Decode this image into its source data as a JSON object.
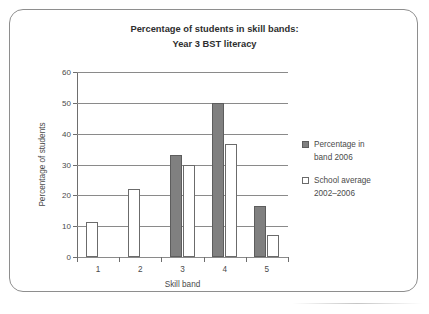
{
  "chart_data": {
    "type": "bar",
    "title": "Percentage of students in skill bands: Year 3 BST literacy",
    "title_lines": [
      "Percentage of students in skill bands:",
      "Year 3 BST literacy"
    ],
    "xlabel": "Skill band",
    "ylabel": "Percentage of students",
    "categories": [
      "1",
      "2",
      "3",
      "4",
      "5"
    ],
    "ylim": [
      0,
      60
    ],
    "yticks": [
      0,
      10,
      20,
      30,
      40,
      50,
      60
    ],
    "ytick_labels": [
      "0",
      "10",
      "20",
      "30",
      "40",
      "50",
      "60"
    ],
    "grid": true,
    "legend_position": "right",
    "series": [
      {
        "name": "Percentage in band 2006",
        "name_lines": [
          "Percentage in",
          "band 2006"
        ],
        "color": "#808080",
        "values": [
          0,
          0,
          33.0,
          50.0,
          16.5
        ]
      },
      {
        "name": "School average 2002–2006",
        "name_lines": [
          "School average",
          "2002–2006"
        ],
        "color": "#ffffff",
        "values": [
          11.3,
          22.0,
          29.7,
          36.7,
          7.2
        ]
      }
    ]
  }
}
